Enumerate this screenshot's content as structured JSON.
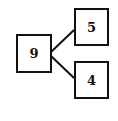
{
  "diagram": {
    "type": "number-bond",
    "whole": {
      "value": "9"
    },
    "parts": [
      {
        "value": "5"
      },
      {
        "value": "4"
      }
    ]
  },
  "colors": {
    "stroke": "#111111",
    "background": "#ffffff"
  }
}
